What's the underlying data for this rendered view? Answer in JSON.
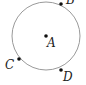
{
  "diagram": {
    "circle": {
      "cx": 46,
      "cy": 36,
      "r": 34,
      "stroke": "#9a9a9a"
    },
    "points": [
      {
        "name": "B",
        "x": 61,
        "y": 4,
        "lx": 66,
        "ly": 4
      },
      {
        "name": "A",
        "x": 46,
        "y": 36,
        "lx": 47,
        "ly": 47
      },
      {
        "name": "C",
        "x": 19,
        "y": 59,
        "lx": 5,
        "ly": 69
      },
      {
        "name": "D",
        "x": 61,
        "y": 70,
        "lx": 63,
        "ly": 81
      }
    ]
  }
}
